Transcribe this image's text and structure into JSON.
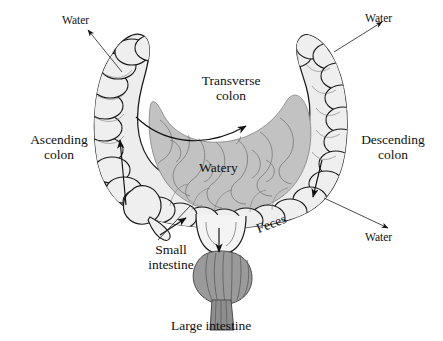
{
  "figure": {
    "caption": "Large intestine"
  },
  "labels": {
    "water_top_left": "Water",
    "water_top_right": "Water",
    "water_bottom_right": "Water",
    "transverse_colon_line1": "Transverse",
    "transverse_colon_line2": "colon",
    "ascending_colon_line1": "Ascending",
    "ascending_colon_line2": "colon",
    "descending_colon_line1": "Descending",
    "descending_colon_line2": "colon",
    "watery": "Watery",
    "feces": "Feces",
    "small_intestine_line1": "Small",
    "small_intestine_line2": "intestine"
  },
  "colors": {
    "background": "#ffffff",
    "colon_fill": "#ededed",
    "colon_fill_shadow": "#e0e0e0",
    "small_intestine_fill": "#c2c2c2",
    "rectum_fill": "#9a9a9a",
    "anal_canal_fill": "#8e8e8e",
    "outline": "#1a1a1a",
    "inner_line": "#555555",
    "text": "#101010",
    "arrow": "#111111"
  },
  "arrows": {
    "water_top_left": "arrow-up-left",
    "water_top_right": "arrow-up-right",
    "water_bottom_right": "arrow-down-right",
    "ascending_flow": "arrow-up",
    "transverse_flow": "arrow-right",
    "descending_flow": "arrow-down-right",
    "ileocecal_flow": "arrow-up-right",
    "rectal_flow": "arrow-down"
  },
  "structures": {
    "ascending_colon": "ascending-colon",
    "transverse_colon": "transverse-colon",
    "descending_colon": "descending-colon",
    "cecum": "cecum",
    "appendix": "appendix",
    "sigmoid_colon": "sigmoid-colon",
    "rectum": "rectum",
    "anal_canal": "anal-canal",
    "small_intestine": "small-intestine-coils"
  }
}
